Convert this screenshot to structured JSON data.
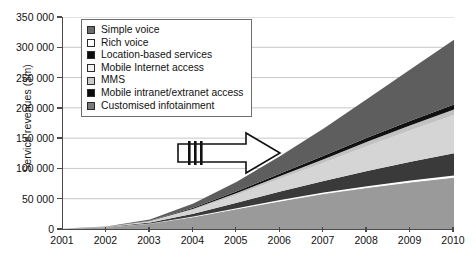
{
  "chart_data": {
    "type": "area",
    "stacked": true,
    "title": "",
    "subtitle": "",
    "xlabel": "",
    "ylabel": "Service revenues ($m)",
    "x": [
      2001,
      2002,
      2003,
      2004,
      2005,
      2006,
      2007,
      2008,
      2009,
      2010
    ],
    "xticklabels": [
      "2001",
      "2002",
      "2003",
      "2004",
      "2005",
      "2006",
      "2007",
      "2008",
      "2009",
      "2010"
    ],
    "xlim": [
      2001,
      2010
    ],
    "ylim": [
      0,
      350000
    ],
    "yticks": [
      0,
      50000,
      100000,
      150000,
      200000,
      250000,
      300000,
      350000
    ],
    "yticklabels": [
      "0",
      "50 000",
      "100 000",
      "150 000",
      "200 000",
      "250 000",
      "300 000",
      "350 000"
    ],
    "grid": "horizontal",
    "legend_position": "top-left-inside",
    "series": [
      {
        "name": "Simple voice",
        "color": "#9a9a9a",
        "swatch": "#6b6b6b",
        "values": [
          1000,
          3000,
          9000,
          20000,
          33000,
          46000,
          58000,
          68000,
          77000,
          85000
        ]
      },
      {
        "name": "Rich voice",
        "color": "#ffffff",
        "swatch": "#ffffff",
        "values": [
          0,
          0,
          200,
          600,
          1200,
          1800,
          2300,
          2700,
          3000,
          3200
        ]
      },
      {
        "name": "Location-based services",
        "color": "#3a3a3a",
        "swatch": "#0d0d0d",
        "values": [
          0,
          200,
          1500,
          4500,
          9000,
          14000,
          19000,
          25000,
          31000,
          37000
        ]
      },
      {
        "name": "Mobile Internet access",
        "color": "#d5d5d5",
        "swatch": "#f2f2f2",
        "values": [
          0,
          300,
          2000,
          6500,
          13000,
          21000,
          30000,
          41000,
          52000,
          63000
        ]
      },
      {
        "name": "MMS",
        "color": "#c2c2c2",
        "swatch": "#c9c9c9",
        "values": [
          0,
          100,
          600,
          1800,
          3200,
          4600,
          6000,
          7200,
          8300,
          9200
        ]
      },
      {
        "name": "Mobile intranet/extranet access",
        "color": "#111111",
        "swatch": "#0a0a0a",
        "values": [
          0,
          100,
          500,
          1500,
          2800,
          4200,
          5500,
          6600,
          7500,
          8200
        ]
      },
      {
        "name": "Customised infotainment",
        "color": "#5e5e5e",
        "swatch": "#7a7a7a",
        "values": [
          0,
          300,
          2000,
          7000,
          16000,
          29000,
          45000,
          64000,
          85000,
          107000
        ]
      }
    ],
    "totals": [
      1000,
      4000,
      15800,
      41900,
      78200,
      120600,
      165800,
      214500,
      263800,
      312600
    ],
    "annotation": {
      "type": "arrow",
      "direction": "right",
      "label": "",
      "tail_bars": 3
    }
  }
}
